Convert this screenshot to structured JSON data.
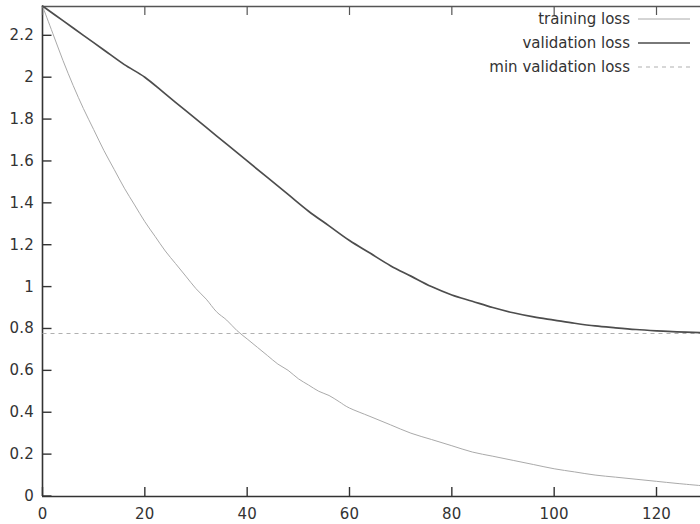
{
  "chart_data": {
    "type": "line",
    "title": "",
    "xlabel": "",
    "ylabel": "",
    "xlim": [
      0,
      128.5
    ],
    "ylim": [
      0,
      2.34
    ],
    "grid": false,
    "legend_position": "top-right",
    "x_ticks": [
      0,
      20,
      40,
      60,
      80,
      100,
      120
    ],
    "x_tick_labels": [
      "0",
      "20",
      "40",
      "60",
      "80",
      "100",
      "120"
    ],
    "y_ticks": [
      0,
      0.2,
      0.4,
      0.6,
      0.8,
      1,
      1.2,
      1.4,
      1.6,
      1.8,
      2,
      2.2
    ],
    "y_tick_labels": [
      "0",
      "0.2",
      "0.4",
      "0.6",
      "0.8",
      "1",
      "1.2",
      "1.4",
      "1.6",
      "1.8",
      "2",
      "2.2"
    ],
    "series": [
      {
        "name": "training loss",
        "style": "solid-thin",
        "color": "#aaaaaa",
        "x": [
          0,
          2,
          4,
          6,
          8,
          10,
          12,
          14,
          16,
          18,
          20,
          22,
          24,
          26,
          28,
          30,
          32,
          34,
          36,
          38,
          40,
          42,
          44,
          46,
          48,
          50,
          52,
          54,
          56,
          58,
          60,
          64,
          68,
          72,
          76,
          80,
          84,
          88,
          92,
          96,
          100,
          104,
          108,
          112,
          116,
          120,
          124,
          128.5
        ],
        "y": [
          2.34,
          2.21,
          2.08,
          1.96,
          1.85,
          1.75,
          1.65,
          1.56,
          1.47,
          1.39,
          1.31,
          1.24,
          1.17,
          1.11,
          1.05,
          0.99,
          0.94,
          0.88,
          0.84,
          0.79,
          0.75,
          0.71,
          0.67,
          0.63,
          0.6,
          0.56,
          0.53,
          0.5,
          0.48,
          0.45,
          0.42,
          0.38,
          0.34,
          0.3,
          0.27,
          0.24,
          0.21,
          0.19,
          0.17,
          0.15,
          0.13,
          0.115,
          0.1,
          0.09,
          0.08,
          0.07,
          0.06,
          0.05
        ]
      },
      {
        "name": "validation loss",
        "style": "solid",
        "color": "#4d4d4d",
        "x": [
          0,
          4,
          8,
          12,
          16,
          20,
          24,
          28,
          32,
          36,
          40,
          44,
          48,
          52,
          56,
          60,
          64,
          68,
          72,
          76,
          80,
          84,
          88,
          92,
          96,
          100,
          104,
          108,
          112,
          116,
          120,
          124,
          128.5
        ],
        "y": [
          2.34,
          2.27,
          2.2,
          2.13,
          2.06,
          2.0,
          1.92,
          1.84,
          1.76,
          1.68,
          1.6,
          1.52,
          1.44,
          1.36,
          1.29,
          1.22,
          1.16,
          1.1,
          1.05,
          1.0,
          0.96,
          0.93,
          0.9,
          0.875,
          0.855,
          0.84,
          0.825,
          0.812,
          0.803,
          0.795,
          0.789,
          0.784,
          0.78
        ]
      }
    ],
    "reference_lines": [
      {
        "name": "min validation loss",
        "orientation": "horizontal",
        "value": 0.776,
        "style": "dashed",
        "color": "#b0b0b0"
      }
    ]
  },
  "legend": {
    "items": [
      {
        "label": "training loss",
        "style": "solid-thin",
        "color": "#aaaaaa"
      },
      {
        "label": "validation loss",
        "style": "solid",
        "color": "#4d4d4d"
      },
      {
        "label": "min validation loss",
        "style": "dashed",
        "color": "#b0b0b0"
      }
    ]
  },
  "axes": {
    "axis_color": "#333333",
    "background": "#ffffff"
  }
}
